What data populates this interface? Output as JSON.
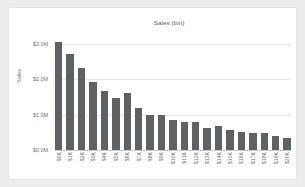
{
  "card": {
    "background": "#ffffff",
    "page_background": "#ececed"
  },
  "chart_data": {
    "type": "bar",
    "title": "Sales (bin)",
    "xlabel": "",
    "ylabel": "Sales",
    "categories": [
      "$0K",
      "$1K",
      "$2K",
      "$3K",
      "$4K",
      "$5K",
      "$6K",
      "$7K",
      "$8K",
      "$9K",
      "$10K",
      "$11K",
      "$12K",
      "$13K",
      "$14K",
      "$15K",
      "$16K",
      "$17K",
      "$18K",
      "$19K",
      "$20K"
    ],
    "values": [
      3050000,
      2720000,
      2320000,
      1930000,
      1660000,
      1470000,
      1600000,
      1180000,
      1000000,
      980000,
      840000,
      800000,
      800000,
      620000,
      680000,
      560000,
      520000,
      490000,
      480000,
      400000,
      330000
    ],
    "ytick_labels": [
      "$3.0M",
      "$2.0M",
      "$1.0M",
      "$0.0M"
    ],
    "ytick_values": [
      3000000,
      2000000,
      1000000,
      0
    ],
    "ylim": [
      0,
      3250000
    ],
    "grid": true,
    "legend": false,
    "bar_color": "#5f6264",
    "grid_color": "#e9eaeb",
    "axis_color": "#c9cbcd",
    "text_color": "#6f7477"
  }
}
